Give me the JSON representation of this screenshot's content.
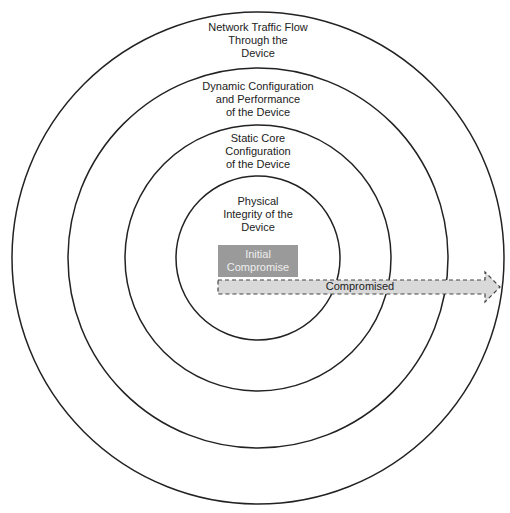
{
  "rings": [
    {
      "label": "Network Traffic Flow Through the Device",
      "lines": [
        "Network Traffic Flow",
        "Through the",
        "Device"
      ]
    },
    {
      "label": "Dynamic Configuration and Performance of the Device",
      "lines": [
        "Dynamic Configuration",
        "and Performance",
        "of the Device"
      ]
    },
    {
      "label": "Static Core Configuration of the Device",
      "lines": [
        "Static Core",
        "Configuration",
        "of the Device"
      ]
    },
    {
      "label": "Physical Integrity of the Device",
      "lines": [
        "Physical",
        "Integrity of the",
        "Device"
      ]
    }
  ],
  "box": {
    "lines": [
      "Initial",
      "Compromise"
    ],
    "color": "#9a9a9a"
  },
  "arrow": {
    "label": "Compromised",
    "color": "#d9d9d9"
  }
}
